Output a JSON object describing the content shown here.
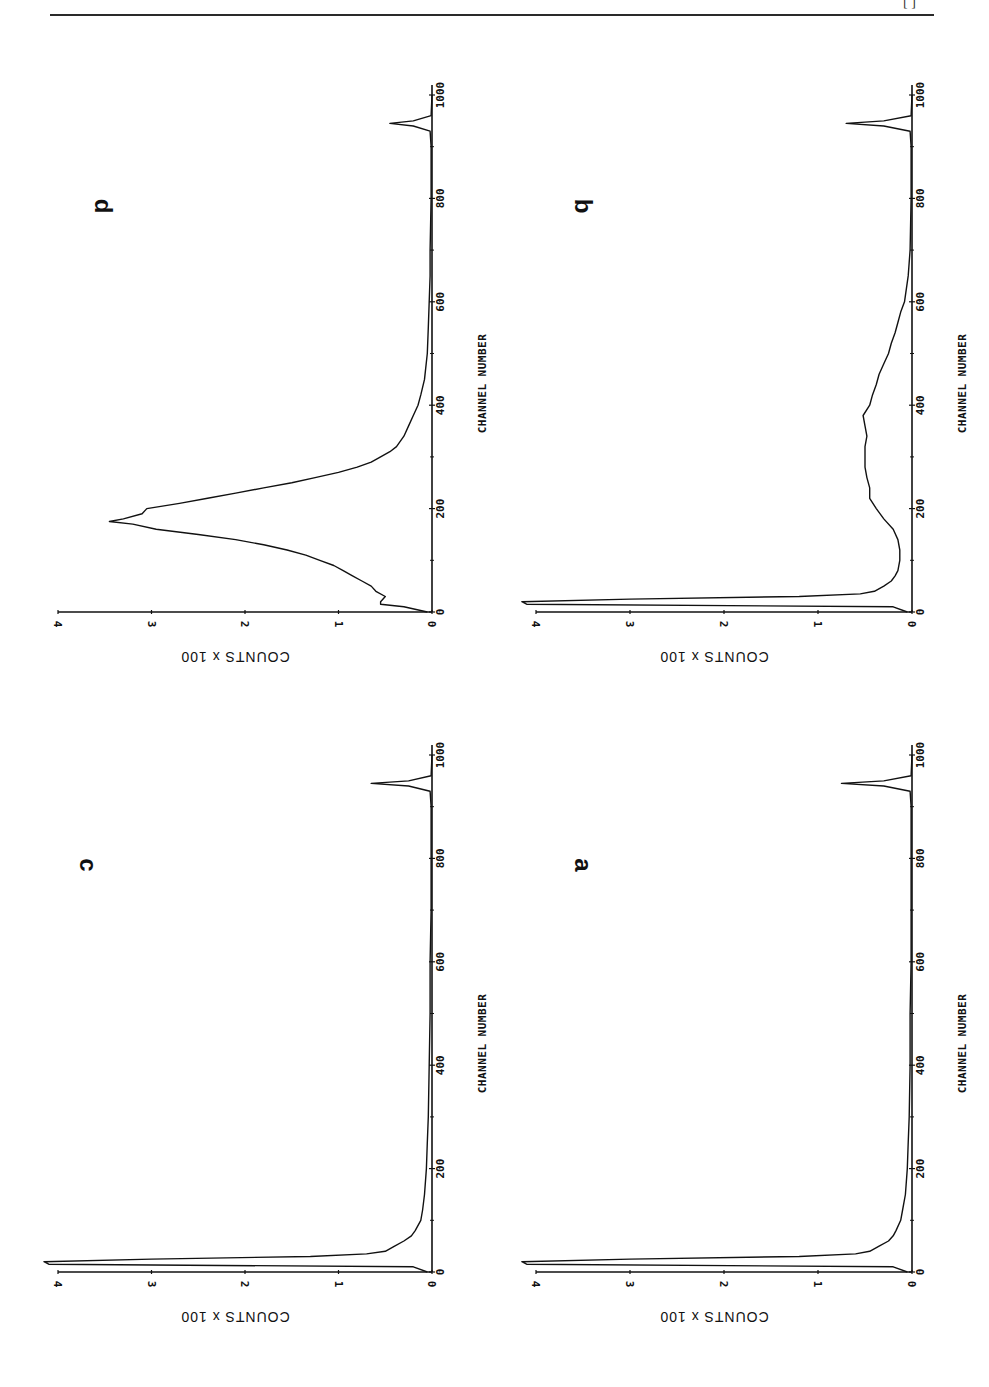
{
  "page": {
    "header_page_number": "[  ]"
  },
  "chart_data": [
    {
      "panel": "d",
      "type": "line",
      "title": "d",
      "xlabel": "CHANNEL NUMBER",
      "ylabel": "COUNTS x 100",
      "xlim": [
        0,
        1000
      ],
      "ylim": [
        0,
        4
      ],
      "xticks": [
        0,
        200,
        400,
        600,
        800,
        1000
      ],
      "yticks": [
        0,
        1,
        2,
        3,
        4
      ],
      "grid": false,
      "orientation_note": "figure printed rotated 90 degrees",
      "x": [
        0,
        10,
        15,
        20,
        30,
        40,
        50,
        60,
        70,
        80,
        90,
        100,
        110,
        120,
        130,
        140,
        150,
        160,
        170,
        175,
        180,
        190,
        200,
        210,
        220,
        230,
        240,
        250,
        260,
        270,
        280,
        290,
        300,
        310,
        320,
        340,
        360,
        380,
        400,
        420,
        450,
        500,
        550,
        600,
        650,
        700,
        800,
        900,
        930,
        940,
        945,
        950,
        960,
        1000
      ],
      "values": [
        0.05,
        0.3,
        0.55,
        0.55,
        0.5,
        0.6,
        0.65,
        0.75,
        0.85,
        0.95,
        1.05,
        1.2,
        1.35,
        1.55,
        1.8,
        2.1,
        2.5,
        2.95,
        3.2,
        3.45,
        3.3,
        3.1,
        3.05,
        2.7,
        2.4,
        2.1,
        1.8,
        1.5,
        1.25,
        1.0,
        0.8,
        0.65,
        0.55,
        0.45,
        0.38,
        0.3,
        0.25,
        0.2,
        0.15,
        0.12,
        0.08,
        0.05,
        0.04,
        0.03,
        0.02,
        0.02,
        0.01,
        0.01,
        0.02,
        0.2,
        0.45,
        0.2,
        0.01,
        0.0
      ]
    },
    {
      "panel": "b",
      "type": "line",
      "title": "b",
      "xlabel": "CHANNEL NUMBER",
      "ylabel": "COUNTS x 100",
      "xlim": [
        0,
        1000
      ],
      "ylim": [
        0,
        4
      ],
      "xticks": [
        0,
        200,
        400,
        600,
        800,
        1000
      ],
      "yticks": [
        0,
        1,
        2,
        3,
        4
      ],
      "grid": false,
      "x": [
        0,
        10,
        15,
        20,
        25,
        30,
        35,
        40,
        50,
        60,
        70,
        80,
        100,
        120,
        140,
        160,
        180,
        200,
        220,
        240,
        260,
        280,
        300,
        320,
        340,
        360,
        380,
        400,
        420,
        440,
        460,
        480,
        500,
        520,
        540,
        560,
        580,
        600,
        650,
        700,
        800,
        900,
        930,
        940,
        945,
        950,
        960,
        1000
      ],
      "values": [
        0.05,
        0.2,
        4.1,
        4.15,
        3.0,
        1.2,
        0.55,
        0.4,
        0.3,
        0.22,
        0.18,
        0.15,
        0.13,
        0.13,
        0.15,
        0.2,
        0.3,
        0.38,
        0.45,
        0.45,
        0.48,
        0.5,
        0.5,
        0.5,
        0.48,
        0.5,
        0.52,
        0.45,
        0.42,
        0.38,
        0.35,
        0.3,
        0.25,
        0.22,
        0.18,
        0.15,
        0.12,
        0.08,
        0.04,
        0.02,
        0.01,
        0.01,
        0.02,
        0.3,
        0.7,
        0.3,
        0.01,
        0.0
      ]
    },
    {
      "panel": "c",
      "type": "line",
      "title": "c",
      "xlabel": "CHANNEL NUMBER",
      "ylabel": "COUNTS x 100",
      "xlim": [
        0,
        1000
      ],
      "ylim": [
        0,
        4
      ],
      "xticks": [
        0,
        200,
        400,
        600,
        800,
        1000
      ],
      "yticks": [
        0,
        1,
        2,
        3,
        4
      ],
      "grid": false,
      "x": [
        0,
        10,
        15,
        20,
        25,
        30,
        35,
        40,
        50,
        60,
        70,
        80,
        100,
        120,
        150,
        200,
        250,
        300,
        400,
        500,
        600,
        700,
        800,
        900,
        930,
        940,
        945,
        950,
        960,
        1000
      ],
      "values": [
        0.05,
        0.2,
        4.1,
        4.15,
        3.0,
        1.3,
        0.7,
        0.5,
        0.4,
        0.3,
        0.22,
        0.18,
        0.12,
        0.1,
        0.08,
        0.06,
        0.05,
        0.04,
        0.03,
        0.02,
        0.02,
        0.01,
        0.01,
        0.01,
        0.02,
        0.25,
        0.65,
        0.25,
        0.01,
        0.0
      ]
    },
    {
      "panel": "a",
      "type": "line",
      "title": "a",
      "xlabel": "CHANNEL NUMBER",
      "ylabel": "COUNTS x 100",
      "xlim": [
        0,
        1000
      ],
      "ylim": [
        0,
        4
      ],
      "xticks": [
        0,
        200,
        400,
        600,
        800,
        1000
      ],
      "yticks": [
        0,
        1,
        2,
        3,
        4
      ],
      "grid": false,
      "x": [
        0,
        10,
        15,
        20,
        25,
        30,
        35,
        40,
        50,
        60,
        70,
        80,
        100,
        120,
        150,
        200,
        250,
        300,
        400,
        500,
        600,
        700,
        800,
        900,
        930,
        940,
        945,
        950,
        960,
        1000
      ],
      "values": [
        0.05,
        0.2,
        4.1,
        4.15,
        3.0,
        1.2,
        0.6,
        0.45,
        0.35,
        0.25,
        0.2,
        0.17,
        0.12,
        0.1,
        0.07,
        0.05,
        0.04,
        0.03,
        0.02,
        0.02,
        0.01,
        0.01,
        0.01,
        0.01,
        0.02,
        0.3,
        0.75,
        0.3,
        0.01,
        0.0
      ]
    }
  ],
  "panels": [
    {
      "letter": "d",
      "xlabel": "CHANNEL NUMBER",
      "ylabel": "COUNTS x 100",
      "xtick_labels": [
        "0",
        "200",
        "400",
        "600",
        "800",
        "1000"
      ],
      "ytick_labels": [
        "0",
        "1",
        "2",
        "3",
        "4"
      ]
    },
    {
      "letter": "b",
      "xlabel": "CHANNEL NUMBER",
      "ylabel": "COUNTS x 100",
      "xtick_labels": [
        "0",
        "200",
        "400",
        "600",
        "800",
        "1000"
      ],
      "ytick_labels": [
        "0",
        "1",
        "2",
        "3",
        "4"
      ]
    },
    {
      "letter": "c",
      "xlabel": "CHANNEL NUMBER",
      "ylabel": "COUNTS x 100",
      "xtick_labels": [
        "0",
        "200",
        "400",
        "600",
        "800",
        "1000"
      ],
      "ytick_labels": [
        "0",
        "1",
        "2",
        "3",
        "4"
      ]
    },
    {
      "letter": "a",
      "xlabel": "CHANNEL NUMBER",
      "ylabel": "COUNTS x 100",
      "xtick_labels": [
        "0",
        "200",
        "400",
        "600",
        "800",
        "1000"
      ],
      "ytick_labels": [
        "0",
        "1",
        "2",
        "3",
        "4"
      ]
    }
  ],
  "colors": {
    "ink": "#111111",
    "paper": "#ffffff"
  }
}
